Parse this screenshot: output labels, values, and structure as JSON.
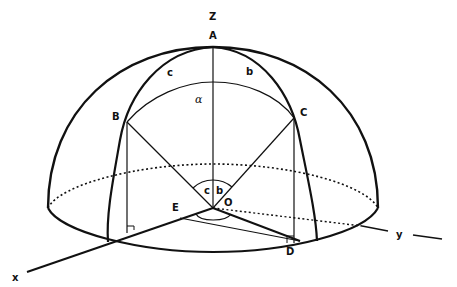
{
  "diagram": {
    "type": "spherical-triangle-hemisphere",
    "labels": {
      "z_axis": "Z",
      "x_axis": "x",
      "y_axis": "y",
      "point_a": "A",
      "point_b": "B",
      "point_c": "C",
      "point_d": "D",
      "point_e": "E",
      "center_o": "O",
      "side_b": "b",
      "side_c": "c",
      "angle_alpha": "α",
      "angle_c_center": "c",
      "angle_b_center": "b"
    },
    "colors": {
      "stroke": "#111111",
      "background": "#ffffff"
    }
  }
}
